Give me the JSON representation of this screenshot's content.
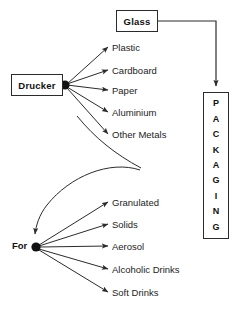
{
  "diagram": {
    "type": "tree-diagram",
    "background_color": "#ffffff",
    "line_color": "#2b2b2b",
    "text_color": "#1d1d1d",
    "nodes": {
      "glass": {
        "label": "Glass",
        "shape": "rectangle",
        "bold": true
      },
      "drucker": {
        "label": "Drucker",
        "shape": "rectangle",
        "bold": true
      },
      "for": {
        "label": "For",
        "shape": "text-with-dot",
        "bold": true
      },
      "packaging": {
        "label": "PACKAGING",
        "shape": "vertical-rectangle",
        "orientation": "vertical",
        "letters": [
          "P",
          "A",
          "C",
          "K",
          "A",
          "G",
          "I",
          "N",
          "G"
        ]
      }
    },
    "branches": {
      "drucker_children": [
        {
          "label": "Plastic"
        },
        {
          "label": "Cardboard"
        },
        {
          "label": "Paper"
        },
        {
          "label": "Aluminium"
        },
        {
          "label": "Other Metals"
        }
      ],
      "for_children": [
        {
          "label": "Granulated"
        },
        {
          "label": "Solids"
        },
        {
          "label": "Aerosol"
        },
        {
          "label": "Alcoholic Drinks"
        },
        {
          "label": "Soft Drinks"
        }
      ]
    },
    "connectors": [
      {
        "from": "glass",
        "to": "packaging",
        "style": "orthogonal-arrow"
      },
      {
        "from": "drucker",
        "to": "for",
        "style": "curved-arrow"
      }
    ]
  }
}
